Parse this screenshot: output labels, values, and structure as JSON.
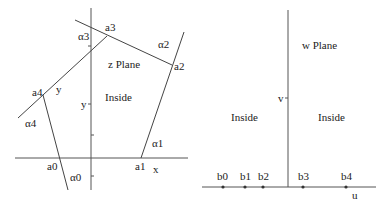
{
  "z_plane": {
    "title": "z Plane",
    "region_label": "Inside",
    "x_axis_label": "x",
    "y_axis_label": "y",
    "edge_label_y": "y",
    "vertices": [
      "a0",
      "a1",
      "a2",
      "a3",
      "a4"
    ],
    "angles": [
      "α0",
      "α1",
      "α2",
      "α3",
      "α4"
    ]
  },
  "w_plane": {
    "title": "w Plane",
    "left_region_label": "Inside",
    "right_region_label": "Inside",
    "u_axis_label": "u",
    "v_axis_label": "v",
    "points": [
      "b0",
      "b1",
      "b2",
      "b3",
      "b4"
    ]
  }
}
